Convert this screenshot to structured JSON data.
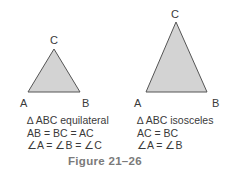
{
  "colors": {
    "triangle_fill": "#d3d3d3",
    "triangle_stroke": "#555555",
    "text": "#3a3a3a",
    "caption": "#7a7a7a"
  },
  "left_triangle": {
    "vertices": {
      "A": "A",
      "B": "B",
      "C": "C"
    },
    "points": "28,92 80,92 54,49",
    "description": [
      "∆ ABC equilateral",
      "AB = BC = AC",
      "∠A = ∠B = ∠C"
    ]
  },
  "right_triangle": {
    "vertices": {
      "A": "A",
      "B": "B",
      "C": "C"
    },
    "points": "146,92 207,92 176,22",
    "description": [
      "∆ ABC isosceles",
      "AC = BC",
      "∠A = ∠B"
    ]
  },
  "caption": "Figure 21–26"
}
